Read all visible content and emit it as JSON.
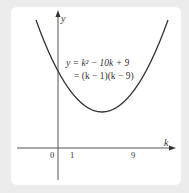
{
  "diagram": {
    "axes": {
      "x_label": "k",
      "y_label": "y",
      "origin_label": "0",
      "x_ticks": [
        "1",
        "9"
      ]
    },
    "equation": {
      "line1": "y = k² − 10k + 9",
      "line2": "= (k − 1)(k − 9)"
    },
    "curve": {
      "type": "parabola",
      "roots": [
        1,
        9
      ],
      "vertex": [
        5,
        -16
      ],
      "y_intercept": 9
    },
    "colors": {
      "background": "#ececec",
      "card": "#ffffff",
      "stroke": "#333333"
    }
  }
}
